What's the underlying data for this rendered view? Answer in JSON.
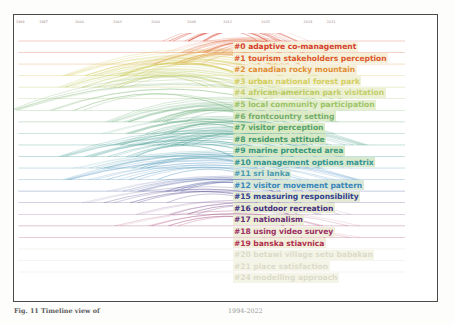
{
  "figure": {
    "caption_left": "Fig. 11  Timeline view of",
    "caption_right": "1994-2022",
    "frame_color": "#4a4a4a",
    "background": "#ffffff"
  },
  "axis": {
    "label": "year",
    "type": "year-timeline",
    "range": [
      1994,
      2022
    ],
    "ticks": [
      {
        "label": "1994",
        "x_pct": 1.5
      },
      {
        "label": "1997",
        "x_pct": 7.0
      },
      {
        "label": "2000",
        "x_pct": 15.5
      },
      {
        "label": "2003",
        "x_pct": 24.5
      },
      {
        "label": "2006",
        "x_pct": 33.5
      },
      {
        "label": "2009",
        "x_pct": 42.0
      },
      {
        "label": "2012",
        "x_pct": 50.5
      },
      {
        "label": "2015",
        "x_pct": 59.5
      },
      {
        "label": "2018",
        "x_pct": 69.5
      },
      {
        "label": "2021",
        "x_pct": 75.0
      }
    ]
  },
  "chart_data": {
    "type": "line",
    "xlabel": "year",
    "ylabel": "cluster",
    "xlim": [
      1994,
      2022
    ],
    "grid": false,
    "legend_position": "right",
    "clusters": [
      {
        "id": 0,
        "tag": "#0",
        "label": "adaptive co-management",
        "color": "#d6402c",
        "highlight": "#f5f0d8",
        "text_opacity": 1.0,
        "baseline_start_pct": 1.0,
        "baseline_end_pct": 92.0,
        "arc_bundle": {
          "start_pct": 35.0,
          "end_pct": 68.0,
          "peak_pct": 52.0,
          "density": 16,
          "height": 17
        }
      },
      {
        "id": 1,
        "tag": "#1",
        "label": "tourism stakeholders perception",
        "color": "#dd5a2e",
        "highlight": "#f5f0d8",
        "text_opacity": 1.0,
        "baseline_start_pct": 1.0,
        "baseline_end_pct": 92.0,
        "arc_bundle": {
          "start_pct": 37.0,
          "end_pct": 72.0,
          "peak_pct": 55.0,
          "density": 14,
          "height": 15
        }
      },
      {
        "id": 2,
        "tag": "#2",
        "label": "canadian rocky mountain",
        "color": "#e08a2e",
        "highlight": "#f5f0d8",
        "text_opacity": 0.95,
        "baseline_start_pct": 1.0,
        "baseline_end_pct": 92.0,
        "arc_bundle": {
          "start_pct": 30.0,
          "end_pct": 70.0,
          "peak_pct": 50.0,
          "density": 13,
          "height": 16
        }
      },
      {
        "id": 3,
        "tag": "#3",
        "label": "urban national forest park",
        "color": "#ccc23a",
        "highlight": "#eef0cf",
        "text_opacity": 0.8,
        "baseline_start_pct": 1.0,
        "baseline_end_pct": 92.0,
        "arc_bundle": {
          "start_pct": 13.0,
          "end_pct": 70.0,
          "peak_pct": 40.0,
          "density": 14,
          "height": 20
        }
      },
      {
        "id": 4,
        "tag": "#4",
        "label": "african-american park visitation",
        "color": "#b6c348",
        "highlight": "#e9eec9",
        "text_opacity": 0.8,
        "baseline_start_pct": 1.0,
        "baseline_end_pct": 92.0,
        "arc_bundle": {
          "start_pct": 12.0,
          "end_pct": 62.0,
          "peak_pct": 36.0,
          "density": 12,
          "height": 18
        }
      },
      {
        "id": 5,
        "tag": "#5",
        "label": "local community participation",
        "color": "#8fbb52",
        "highlight": "#e2edc7",
        "text_opacity": 0.85,
        "baseline_start_pct": 1.0,
        "baseline_end_pct": 92.0,
        "arc_bundle": {
          "start_pct": 52.0,
          "end_pct": 80.0,
          "peak_pct": 66.0,
          "density": 10,
          "height": 11
        }
      },
      {
        "id": 6,
        "tag": "#6",
        "label": "frontcountry setting",
        "color": "#6aa85e",
        "highlight": "#ddebc4",
        "text_opacity": 0.9,
        "baseline_start_pct": 1.0,
        "baseline_end_pct": 92.0,
        "arc_bundle": {
          "start_pct": 0.5,
          "end_pct": 77.0,
          "peak_pct": 30.0,
          "density": 6,
          "height": 26
        }
      },
      {
        "id": 7,
        "tag": "#7",
        "label": "visitor perception",
        "color": "#4f9f63",
        "highlight": "#daeac2",
        "text_opacity": 0.95,
        "baseline_start_pct": 1.0,
        "baseline_end_pct": 92.0,
        "arc_bundle": {
          "start_pct": 23.0,
          "end_pct": 75.0,
          "peak_pct": 48.0,
          "density": 13,
          "height": 19
        }
      },
      {
        "id": 8,
        "tag": "#8",
        "label": "residents attitude",
        "color": "#3d9668",
        "highlight": "#d8e9c4",
        "text_opacity": 0.95,
        "baseline_start_pct": 1.0,
        "baseline_end_pct": 92.0,
        "arc_bundle": {
          "start_pct": 22.0,
          "end_pct": 74.0,
          "peak_pct": 47.0,
          "density": 11,
          "height": 17
        }
      },
      {
        "id": 9,
        "tag": "#9",
        "label": "marine protected area",
        "color": "#2f9277",
        "highlight": "#d6e8c4",
        "text_opacity": 0.95,
        "baseline_start_pct": 1.0,
        "baseline_end_pct": 92.0,
        "arc_bundle": {
          "start_pct": 25.0,
          "end_pct": 82.0,
          "peak_pct": 52.0,
          "density": 12,
          "height": 18
        }
      },
      {
        "id": 10,
        "tag": "#10",
        "label": "management options matrix",
        "color": "#2b8f8c",
        "highlight": "#d6e8cc",
        "text_opacity": 0.95,
        "baseline_start_pct": 1.0,
        "baseline_end_pct": 92.0,
        "arc_bundle": {
          "start_pct": 12.0,
          "end_pct": 76.0,
          "peak_pct": 40.0,
          "density": 11,
          "height": 20
        }
      },
      {
        "id": 11,
        "tag": "#11",
        "label": "sri lanka",
        "color": "#3a93a8",
        "highlight": "#d8e7d4",
        "text_opacity": 0.9,
        "baseline_start_pct": 1.0,
        "baseline_end_pct": 92.0,
        "arc_bundle": {
          "start_pct": 14.0,
          "end_pct": 78.0,
          "peak_pct": 44.0,
          "density": 10,
          "height": 17
        }
      },
      {
        "id": 12,
        "tag": "#12",
        "label": "visitor movement pattern",
        "color": "#3a86bb",
        "highlight": "#d9e7d8",
        "text_opacity": 1.0,
        "baseline_start_pct": 1.0,
        "baseline_end_pct": 92.0,
        "arc_bundle": {
          "start_pct": 13.0,
          "end_pct": 80.0,
          "peak_pct": 45.0,
          "density": 9,
          "height": 19
        }
      },
      {
        "id": 15,
        "tag": "#15",
        "label": "measuring responsibility",
        "color": "#30408f",
        "highlight": "#e4ead3",
        "text_opacity": 1.0,
        "baseline_start_pct": 1.0,
        "baseline_end_pct": 92.0,
        "arc_bundle": {
          "start_pct": 22.0,
          "end_pct": 76.0,
          "peak_pct": 52.0,
          "density": 10,
          "height": 15
        }
      },
      {
        "id": 16,
        "tag": "#16",
        "label": "outdoor recreation",
        "color": "#45307f",
        "highlight": "#e9ecd4",
        "text_opacity": 1.0,
        "baseline_start_pct": 1.0,
        "baseline_end_pct": 92.0,
        "arc_bundle": {
          "start_pct": 16.0,
          "end_pct": 74.0,
          "peak_pct": 46.0,
          "density": 7,
          "height": 16
        }
      },
      {
        "id": 17,
        "tag": "#17",
        "label": "nationalism",
        "color": "#6b2f76",
        "highlight": "#edeed6",
        "text_opacity": 1.0,
        "baseline_start_pct": 1.0,
        "baseline_end_pct": 92.0,
        "arc_bundle": {
          "start_pct": 30.0,
          "end_pct": 78.0,
          "peak_pct": 54.0,
          "density": 6,
          "height": 14
        }
      },
      {
        "id": 18,
        "tag": "#18",
        "label": "using video survey",
        "color": "#9c2f63",
        "highlight": "#efeedb",
        "text_opacity": 1.0,
        "baseline_start_pct": 1.0,
        "baseline_end_pct": 92.0,
        "arc_bundle": {
          "start_pct": 25.0,
          "end_pct": 80.0,
          "peak_pct": 50.0,
          "density": 6,
          "height": 15
        }
      },
      {
        "id": 19,
        "tag": "#19",
        "label": "banska stiavnica",
        "color": "#b02f4e",
        "highlight": "#f1efdc",
        "text_opacity": 1.0,
        "baseline_start_pct": 1.0,
        "baseline_end_pct": 92.0,
        "arc_bundle": {
          "start_pct": 60.0,
          "end_pct": 80.0,
          "peak_pct": 70.0,
          "density": 3,
          "height": 5
        }
      },
      {
        "id": 20,
        "tag": "#20",
        "label": "betawi village setu babakan",
        "color": "#c0bfa0",
        "highlight": "#eeeed5",
        "text_opacity": 0.55,
        "baseline_start_pct": 1.0,
        "baseline_end_pct": 92.0,
        "arc_bundle": null
      },
      {
        "id": 21,
        "tag": "#21",
        "label": "place satisfaction",
        "color": "#c0bfa0",
        "highlight": "#eeeed5",
        "text_opacity": 0.55,
        "baseline_start_pct": 1.0,
        "baseline_end_pct": 92.0,
        "arc_bundle": null
      },
      {
        "id": 24,
        "tag": "#24",
        "label": "modelling approach",
        "color": "#c0bfa0",
        "highlight": "#eeeed5",
        "text_opacity": 0.55,
        "baseline_start_pct": 1.0,
        "baseline_end_pct": 92.0,
        "arc_bundle": null
      }
    ]
  }
}
